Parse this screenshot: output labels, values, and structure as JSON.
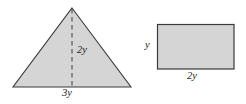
{
  "figure": {
    "colors": {
      "shape_fill": "#d5d5d5",
      "shape_stroke": "#3a3a3a",
      "label_text": "#1a1a1a",
      "background": "#ffffff"
    },
    "shapes": {
      "triangle": {
        "name": "shaded-triangle",
        "apex": {
          "x": 72,
          "y": 8
        },
        "base_left": {
          "x": 13,
          "y": 87
        },
        "base_right": {
          "x": 131,
          "y": 87
        },
        "height_line": {
          "style": "dashed",
          "from": {
            "x": 72,
            "y": 8
          },
          "to": {
            "x": 72,
            "y": 87
          }
        },
        "labels": {
          "height": "2y",
          "base": "3y"
        }
      },
      "rectangle": {
        "name": "shaded-rectangle",
        "left": 157,
        "top": 24,
        "right": 234,
        "bottom": 69,
        "labels": {
          "height": "y",
          "width": "2y"
        }
      }
    }
  }
}
